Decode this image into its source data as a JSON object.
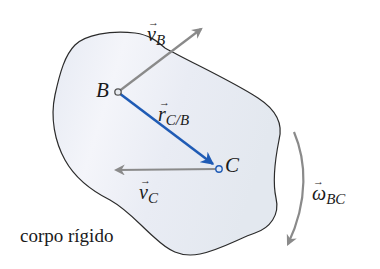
{
  "diagram": {
    "type": "rigid-body-kinematics",
    "body_label": "corpo rígido",
    "points": [
      {
        "id": "B",
        "label": "B"
      },
      {
        "id": "C",
        "label": "C"
      }
    ],
    "vectors": {
      "v_B": {
        "symbol": "v",
        "arrow": "→",
        "subscript": "B"
      },
      "r_CB": {
        "symbol": "r",
        "arrow": "→",
        "subscript": "C/B"
      },
      "v_C": {
        "symbol": "v",
        "arrow": "→",
        "subscript": "C"
      },
      "omega_BC": {
        "symbol": "ω",
        "arrow": "→",
        "subscript": "BC"
      }
    },
    "colors": {
      "body_fill": "#eef1f6",
      "body_stroke": "#2b2b2b",
      "gray_vector": "#8a8a8a",
      "blue_vector": "#1f5bb5",
      "text": "#1a1a1a"
    }
  }
}
